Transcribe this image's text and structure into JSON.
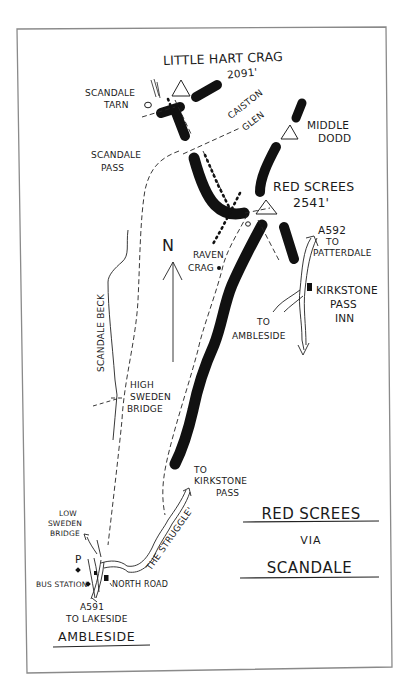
{
  "map": {
    "title_line1": "RED SCREES",
    "title_line2": "VIA",
    "title_line3": "SCANDALE",
    "north_label": "N",
    "summits": [
      {
        "name": "LITTLE HART CRAG",
        "height": "2091'"
      },
      {
        "name": "MIDDLE DODD",
        "line1": "MIDDLE",
        "line2": "DODD"
      },
      {
        "name": "RED SCREES",
        "height": "2541'"
      }
    ],
    "labels": {
      "scandale_tarn_1": "SCANDALE",
      "scandale_tarn_2": "TARN",
      "caiston_glen_1": "CAISTON",
      "caiston_glen_2": "GLEN",
      "scandale_pass_1": "SCANDALE",
      "scandale_pass_2": "PASS",
      "raven_crag_1": "RAVEN",
      "raven_crag_2": "CRAG",
      "a592_1": "A592",
      "a592_2": "TO",
      "a592_3": "PATTERDALE",
      "kirkstone_inn_1": "KIRKSTONE",
      "kirkstone_inn_2": "PASS",
      "kirkstone_inn_3": "INN",
      "to_ambleside_1": "TO",
      "to_ambleside_2": "AMBLESIDE",
      "scandale_beck": "SCANDALE BECK",
      "high_sweden_1": "HIGH",
      "high_sweden_2": "SWEDEN",
      "high_sweden_3": "BRIDGE",
      "to_kirkstone_1": "TO",
      "to_kirkstone_2": "KIRKSTONE",
      "to_kirkstone_3": "PASS",
      "the_struggle": "THE STRUGGLE'",
      "low_sweden_1": "LOW",
      "low_sweden_2": "SWEDEN",
      "low_sweden_3": "BRIDGE",
      "parking": "P",
      "bus_station": "BUS STATION",
      "north_road": "NORTH ROAD",
      "a591_1": "A591",
      "a591_2": "TO LAKESIDE",
      "ambleside": "AMBLESIDE"
    },
    "colors": {
      "ink": "#1a1a1a",
      "frame": "#8a8a8a",
      "paper": "#ffffff"
    }
  }
}
